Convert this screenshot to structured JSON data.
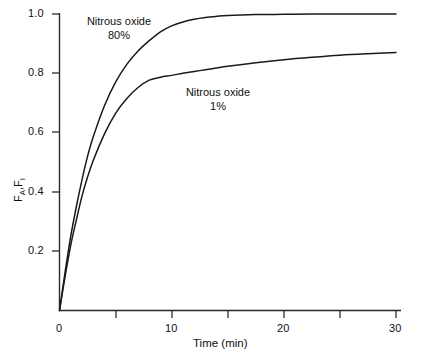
{
  "chart_data": {
    "type": "line",
    "title": "",
    "subtitle": "",
    "xlabel": "Time (min)",
    "ylabel": "F A /F I",
    "ylabel_parts": {
      "base1": "F",
      "sub1": "A",
      "base2": "F",
      "sub2": "I"
    },
    "xlim": [
      0,
      30
    ],
    "ylim": [
      0,
      1.05
    ],
    "x_ticks_major": [
      0,
      10,
      20,
      30
    ],
    "x_ticks_minor": [
      5,
      15,
      25
    ],
    "x_tick_labels": [
      "0",
      "10",
      "20",
      "30"
    ],
    "y_ticks_major": [
      0.2,
      0.4,
      0.6,
      0.8,
      1.0
    ],
    "y_tick_labels": [
      "0.2",
      "0.4",
      "0.6",
      "0.8",
      "1.0"
    ],
    "grid": false,
    "legend_position": "inline-annotations",
    "line_color": "#1a1a1a",
    "background_color": "#ffffff",
    "axis_color": "#2b2b2b",
    "series": [
      {
        "name": "Nitrous oxide 80%",
        "annotation_line1": "Nitrous oxide",
        "annotation_line2": "80%",
        "x": [
          0,
          0.5,
          1,
          1.5,
          2,
          2.5,
          3,
          4,
          5,
          6,
          7,
          8,
          9,
          10,
          11,
          12,
          13,
          14,
          15,
          17.5,
          20,
          22.5,
          25,
          27.5,
          30
        ],
        "values": [
          0.0,
          0.13,
          0.25,
          0.35,
          0.44,
          0.52,
          0.585,
          0.69,
          0.77,
          0.83,
          0.875,
          0.91,
          0.94,
          0.96,
          0.973,
          0.982,
          0.988,
          0.992,
          0.995,
          0.998,
          0.999,
          1.0,
          1.0,
          1.0,
          1.0
        ]
      },
      {
        "name": "Nitrous oxide 1%",
        "annotation_line1": "Nitrous oxide",
        "annotation_line2": "1%",
        "x": [
          0,
          0.5,
          1,
          1.5,
          2,
          2.5,
          3,
          4,
          5,
          6,
          7,
          8,
          9,
          10,
          11,
          12,
          13,
          14,
          15,
          17.5,
          20,
          22.5,
          25,
          27.5,
          30
        ],
        "values": [
          0.0,
          0.115,
          0.22,
          0.305,
          0.385,
          0.45,
          0.505,
          0.595,
          0.665,
          0.715,
          0.752,
          0.777,
          0.787,
          0.793,
          0.8,
          0.806,
          0.812,
          0.818,
          0.824,
          0.836,
          0.846,
          0.854,
          0.861,
          0.866,
          0.87
        ]
      }
    ]
  }
}
